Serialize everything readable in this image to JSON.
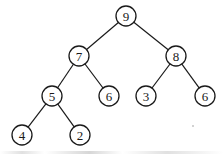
{
  "diagram": {
    "type": "binary-tree",
    "title": "",
    "nodes": [
      {
        "id": "n0",
        "label": "9",
        "x": 126,
        "y": 16
      },
      {
        "id": "n1",
        "label": "7",
        "x": 79,
        "y": 56
      },
      {
        "id": "n2",
        "label": "8",
        "x": 176,
        "y": 56
      },
      {
        "id": "n3",
        "label": "5",
        "x": 52,
        "y": 96
      },
      {
        "id": "n4",
        "label": "6",
        "x": 109,
        "y": 96
      },
      {
        "id": "n5",
        "label": "3",
        "x": 146,
        "y": 96
      },
      {
        "id": "n6",
        "label": "6",
        "x": 205,
        "y": 96
      },
      {
        "id": "n7",
        "label": "4",
        "x": 22,
        "y": 135
      },
      {
        "id": "n8",
        "label": "2",
        "x": 80,
        "y": 135
      }
    ],
    "edges": [
      [
        "n0",
        "n1"
      ],
      [
        "n0",
        "n2"
      ],
      [
        "n1",
        "n3"
      ],
      [
        "n1",
        "n4"
      ],
      [
        "n2",
        "n5"
      ],
      [
        "n2",
        "n6"
      ],
      [
        "n3",
        "n7"
      ],
      [
        "n3",
        "n8"
      ]
    ],
    "node_radius": 10,
    "colors": {
      "stroke": "#1a1a1a",
      "fill": "#ffffff",
      "background": "#ffffff"
    }
  }
}
